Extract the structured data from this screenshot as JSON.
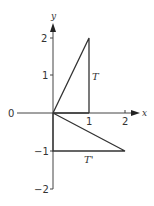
{
  "diagram": {
    "axes": {
      "x_label": "x",
      "y_label": "y",
      "x_ticks": [
        {
          "value": 1,
          "label": "1"
        },
        {
          "value": 2,
          "label": "2"
        }
      ],
      "y_ticks": [
        {
          "value": 2,
          "label": "2"
        },
        {
          "value": 1,
          "label": "1"
        },
        {
          "value": 0,
          "label": "0"
        },
        {
          "value": -1,
          "label": "−1"
        },
        {
          "value": -2,
          "label": "−2"
        }
      ]
    },
    "shapes": [
      {
        "name": "T",
        "label": "T",
        "vertices": [
          [
            0,
            0
          ],
          [
            1,
            2
          ],
          [
            1,
            0
          ]
        ]
      },
      {
        "name": "T'",
        "label": "T'",
        "vertices": [
          [
            0,
            0
          ],
          [
            2,
            -1
          ],
          [
            0,
            -1
          ]
        ]
      }
    ],
    "colors": {
      "line": "#333333",
      "background": "#ffffff"
    }
  }
}
